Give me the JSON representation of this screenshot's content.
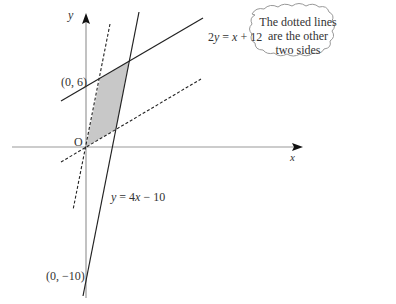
{
  "diagram": {
    "axes": {
      "x_label": "x",
      "y_label": "y",
      "origin_label": "O"
    },
    "points": [
      {
        "label": "(0, 6)"
      },
      {
        "label": "(0, −10)"
      }
    ],
    "lines": [
      {
        "equation": "2y = x + 12",
        "style": "solid"
      },
      {
        "equation": "y = 4x − 10",
        "style": "solid"
      },
      {
        "equation": "dotted, through O, parallel to y = 4x − 10",
        "style": "dashed"
      },
      {
        "equation": "dotted, through O, parallel to 2y = x + 12",
        "style": "dashed"
      }
    ],
    "shaded_region": "parallelogram",
    "callout": {
      "line1": "The dotted lines",
      "line2": "are the other",
      "line3": "two sides"
    },
    "colors": {
      "axis": "#999999",
      "line": "#222222",
      "shade": "#c8c8c8"
    }
  }
}
